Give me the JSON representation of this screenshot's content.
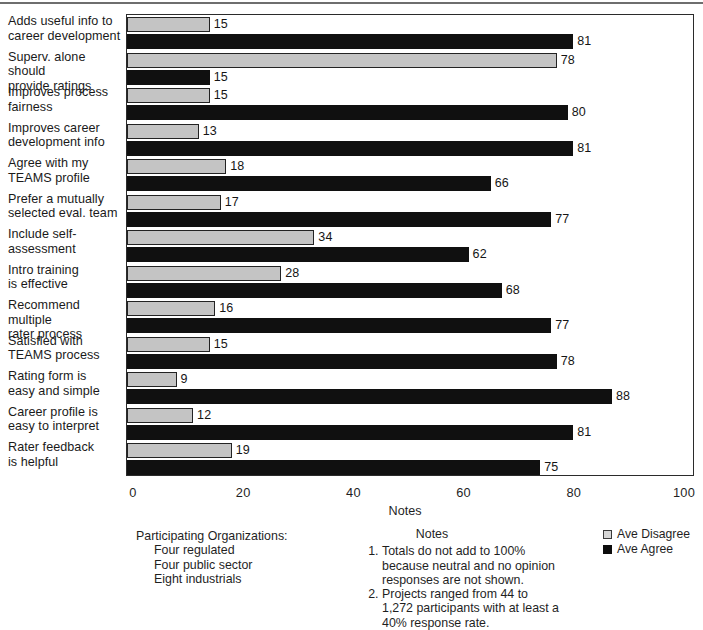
{
  "chart_data": {
    "type": "bar",
    "orientation": "horizontal",
    "title": "",
    "xlabel": "Notes",
    "ylabel": "",
    "xlim": [
      0,
      100
    ],
    "xticks": [
      0,
      20,
      40,
      60,
      80,
      100
    ],
    "xtick_labels": [
      "0",
      "20",
      "40",
      "60",
      "80",
      "100"
    ],
    "grid": false,
    "legend_position": "bottom-right",
    "categories": [
      "Adds useful info to career development",
      "Superv. alone should provide ratings",
      "Improves process fairness",
      "Improves career development info",
      "Agree with my TEAMS profile",
      "Prefer a mutually selected eval. team",
      "Include self-assessment",
      "Intro training is effective",
      "Recommend multiple rater process",
      "Satisfied with TEAMS process",
      "Rating form is easy and simple",
      "Career profile is easy to interpret",
      "Rater feedback is helpful"
    ],
    "category_lines": [
      [
        "Adds useful info to",
        "career development"
      ],
      [
        "Superv. alone should",
        "provide ratings"
      ],
      [
        "Improves process",
        "fairness"
      ],
      [
        "Improves career",
        "development info"
      ],
      [
        "Agree with my",
        "TEAMS profile"
      ],
      [
        "Prefer a mutually",
        "selected eval. team"
      ],
      [
        "Include self-",
        "assessment"
      ],
      [
        "Intro training",
        "is effective"
      ],
      [
        "Recommend multiple",
        "rater process"
      ],
      [
        "Satisfied with",
        "TEAMS process"
      ],
      [
        "Rating form is",
        "easy and simple"
      ],
      [
        "Career profile is",
        "easy to interpret"
      ],
      [
        "Rater feedback",
        "is helpful"
      ]
    ],
    "series": [
      {
        "name": "Ave Disagree",
        "color": "#c4c4c4",
        "values": [
          15,
          78,
          15,
          13,
          18,
          17,
          34,
          28,
          16,
          15,
          9,
          12,
          19
        ]
      },
      {
        "name": "Ave Agree",
        "color": "#101010",
        "values": [
          81,
          15,
          80,
          81,
          66,
          77,
          62,
          68,
          77,
          78,
          88,
          81,
          75
        ]
      }
    ]
  },
  "legend": {
    "entries": [
      {
        "label": "Ave Disagree",
        "swatch": "disagree"
      },
      {
        "label": "Ave Agree",
        "swatch": "agree"
      }
    ]
  },
  "participating": {
    "title": "Participating Organizations:",
    "items": [
      "Four regulated",
      "Four public sector",
      "Eight industrials"
    ]
  },
  "notes": {
    "heading": "Notes",
    "items": [
      "Totals do not add to 100% because neutral and no opinion responses are not shown.",
      "Projects ranged from 44 to 1,272 participants with at least a 40% response rate."
    ]
  }
}
